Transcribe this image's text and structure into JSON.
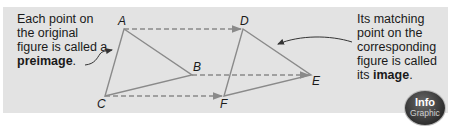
{
  "captions": {
    "left": {
      "text": "Each point on the original figure is called a ",
      "term": "preimage",
      "end": "."
    },
    "right": {
      "text": "Its matching point on the corresponding figure is called its ",
      "term": "image",
      "end": "."
    }
  },
  "preimage": {
    "vertices": [
      {
        "label": "A"
      },
      {
        "label": "B"
      },
      {
        "label": "C"
      }
    ]
  },
  "image": {
    "vertices": [
      {
        "label": "D"
      },
      {
        "label": "E"
      },
      {
        "label": "F"
      }
    ]
  },
  "badge": {
    "line1": "Info",
    "line2": "Graphic"
  },
  "colors": {
    "panel": "#e3e3e3",
    "figure_stroke": "#8a8a8a",
    "arrow_stroke": "#8a8a8a",
    "text": "#1a1a1a"
  }
}
